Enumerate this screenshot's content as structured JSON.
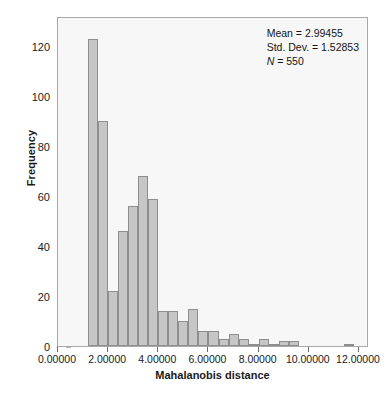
{
  "chart_data": {
    "type": "bar",
    "subtype": "histogram",
    "title": "",
    "xlabel": "Mahalanobis distance",
    "ylabel": "Frequency",
    "xlim": [
      0,
      12.4
    ],
    "ylim": [
      0,
      132
    ],
    "grid": false,
    "bin_width": 0.4,
    "x_tick_labels": [
      "0.00000",
      "2.00000",
      "4.00000",
      "6.00000",
      "8.00000",
      "10.00000",
      "12.00000"
    ],
    "x_tick_values": [
      0,
      2,
      4,
      6,
      8,
      10,
      12
    ],
    "y_tick_labels": [
      "0",
      "20",
      "40",
      "60",
      "80",
      "100",
      "120"
    ],
    "y_tick_values": [
      0,
      20,
      40,
      60,
      80,
      100,
      120
    ],
    "bins": [
      {
        "start": 1.2,
        "end": 1.6,
        "value": 123
      },
      {
        "start": 1.6,
        "end": 2.0,
        "value": 90
      },
      {
        "start": 2.0,
        "end": 2.4,
        "value": 22
      },
      {
        "start": 2.4,
        "end": 2.8,
        "value": 46
      },
      {
        "start": 2.8,
        "end": 3.2,
        "value": 56
      },
      {
        "start": 3.2,
        "end": 3.6,
        "value": 68
      },
      {
        "start": 3.6,
        "end": 4.0,
        "value": 59
      },
      {
        "start": 4.0,
        "end": 4.4,
        "value": 14
      },
      {
        "start": 4.4,
        "end": 4.8,
        "value": 14
      },
      {
        "start": 4.8,
        "end": 5.2,
        "value": 10
      },
      {
        "start": 5.2,
        "end": 5.6,
        "value": 15
      },
      {
        "start": 5.6,
        "end": 6.0,
        "value": 6
      },
      {
        "start": 6.0,
        "end": 6.4,
        "value": 6
      },
      {
        "start": 6.4,
        "end": 6.8,
        "value": 3
      },
      {
        "start": 6.8,
        "end": 7.2,
        "value": 5
      },
      {
        "start": 7.2,
        "end": 7.6,
        "value": 3
      },
      {
        "start": 7.6,
        "end": 8.0,
        "value": 1
      },
      {
        "start": 8.0,
        "end": 8.4,
        "value": 3
      },
      {
        "start": 8.4,
        "end": 8.8,
        "value": 1
      },
      {
        "start": 8.8,
        "end": 9.2,
        "value": 2
      },
      {
        "start": 9.2,
        "end": 9.6,
        "value": 2
      },
      {
        "start": 11.4,
        "end": 11.8,
        "value": 1
      }
    ],
    "annotations": {
      "mean_label": "Mean = 2.99455",
      "std_dev_label": "Std. Dev. = 1.52853",
      "n_label_prefix": "N",
      "n_label_suffix": " = 550",
      "mean": 2.99455,
      "std_dev": 1.52853,
      "n": 550
    }
  },
  "caption": {
    "text": ""
  },
  "colors": {
    "bar_fill": "#c6c6c6",
    "bar_border": "#8e8e8e",
    "plot_background": "#f7f7f7",
    "frame_border": "#a8a8a8",
    "text": "#1a1a1a"
  }
}
